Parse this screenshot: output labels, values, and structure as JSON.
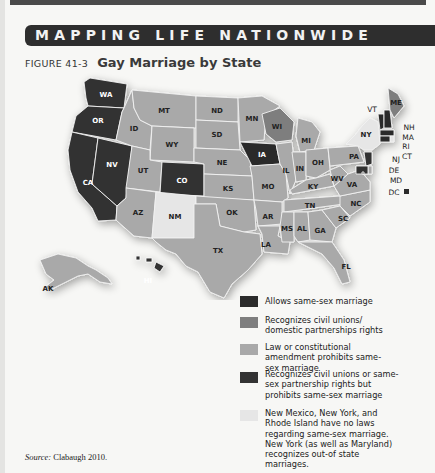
{
  "banner": {
    "title": "MAPPING LIFE NATIONWIDE"
  },
  "figure": {
    "number": "FIGURE 41-3",
    "title": "Gay Marriage by State"
  },
  "categories": {
    "allows": {
      "label": "Allows same-sex marriage",
      "color": "#2b2b2b"
    },
    "civil_unions": {
      "label": "Recognizes civil unions/ domestic partnerships rights",
      "color": "#7e7e7e"
    },
    "prohibits": {
      "label": "Law or constitutional amendment prohibits same-sex marriage",
      "color": "#a9a9a9"
    },
    "civil_but_prohibits": {
      "label": "Recognizes civil unions or same-sex partnership rights but prohibits same-sex marriage",
      "color": "#333333"
    },
    "no_laws": {
      "label": "New Mexico, New York, and Rhode Island have no laws regarding same-sex marriage. New York (as well as Maryland) recognizes out-of state marriages.",
      "color": "#e6e6e6"
    }
  },
  "legend": [
    {
      "key": "allows",
      "text": "Allows same-sex marriage"
    },
    {
      "key": "civil_unions",
      "text": "Recognizes civil unions/ domestic partnerships rights"
    },
    {
      "key": "prohibits",
      "text": "Law or constitutional amendment prohibits same-sex marriage"
    },
    {
      "key": "civil_but_prohibits",
      "text": "Recognizes civil unions or same-sex partnership rights but prohibits same-sex marriage"
    },
    {
      "key": "no_laws",
      "text": "New Mexico, New York, and Rhode Island have no laws regarding same-sex marriage. New York (as well as Maryland) recognizes out-of state marriages."
    }
  ],
  "states": [
    {
      "abbr": "WA",
      "status": "civil_but_prohibits"
    },
    {
      "abbr": "OR",
      "status": "civil_but_prohibits"
    },
    {
      "abbr": "CA",
      "status": "civil_but_prohibits"
    },
    {
      "abbr": "NV",
      "status": "civil_but_prohibits"
    },
    {
      "abbr": "ID",
      "status": "prohibits"
    },
    {
      "abbr": "MT",
      "status": "prohibits"
    },
    {
      "abbr": "WY",
      "status": "prohibits"
    },
    {
      "abbr": "UT",
      "status": "prohibits"
    },
    {
      "abbr": "CO",
      "status": "civil_but_prohibits"
    },
    {
      "abbr": "AZ",
      "status": "prohibits"
    },
    {
      "abbr": "NM",
      "status": "no_laws"
    },
    {
      "abbr": "ND",
      "status": "prohibits"
    },
    {
      "abbr": "SD",
      "status": "prohibits"
    },
    {
      "abbr": "NE",
      "status": "prohibits"
    },
    {
      "abbr": "KS",
      "status": "prohibits"
    },
    {
      "abbr": "OK",
      "status": "prohibits"
    },
    {
      "abbr": "TX",
      "status": "prohibits"
    },
    {
      "abbr": "MN",
      "status": "prohibits"
    },
    {
      "abbr": "IA",
      "status": "allows"
    },
    {
      "abbr": "MO",
      "status": "prohibits"
    },
    {
      "abbr": "AR",
      "status": "prohibits"
    },
    {
      "abbr": "LA",
      "status": "prohibits"
    },
    {
      "abbr": "WI",
      "status": "civil_unions"
    },
    {
      "abbr": "IL",
      "status": "prohibits"
    },
    {
      "abbr": "MI",
      "status": "prohibits"
    },
    {
      "abbr": "IN",
      "status": "prohibits"
    },
    {
      "abbr": "OH",
      "status": "prohibits"
    },
    {
      "abbr": "KY",
      "status": "prohibits"
    },
    {
      "abbr": "TN",
      "status": "prohibits"
    },
    {
      "abbr": "MS",
      "status": "prohibits"
    },
    {
      "abbr": "AL",
      "status": "prohibits"
    },
    {
      "abbr": "GA",
      "status": "prohibits"
    },
    {
      "abbr": "FL",
      "status": "prohibits"
    },
    {
      "abbr": "SC",
      "status": "prohibits"
    },
    {
      "abbr": "NC",
      "status": "prohibits"
    },
    {
      "abbr": "VA",
      "status": "prohibits"
    },
    {
      "abbr": "WV",
      "status": "prohibits"
    },
    {
      "abbr": "PA",
      "status": "prohibits"
    },
    {
      "abbr": "NY",
      "status": "no_laws"
    },
    {
      "abbr": "VT",
      "status": "allows"
    },
    {
      "abbr": "NH",
      "status": "allows"
    },
    {
      "abbr": "ME",
      "status": "civil_unions"
    },
    {
      "abbr": "MA",
      "status": "allows"
    },
    {
      "abbr": "RI",
      "status": "no_laws"
    },
    {
      "abbr": "CT",
      "status": "allows"
    },
    {
      "abbr": "NJ",
      "status": "civil_but_prohibits"
    },
    {
      "abbr": "DE",
      "status": "prohibits"
    },
    {
      "abbr": "MD",
      "status": "civil_but_prohibits"
    },
    {
      "abbr": "DC",
      "status": "allows"
    },
    {
      "abbr": "AK",
      "status": "prohibits"
    },
    {
      "abbr": "HI",
      "status": "civil_but_prohibits"
    }
  ],
  "source": {
    "label": "Source:",
    "text": "Clabaugh 2010."
  }
}
